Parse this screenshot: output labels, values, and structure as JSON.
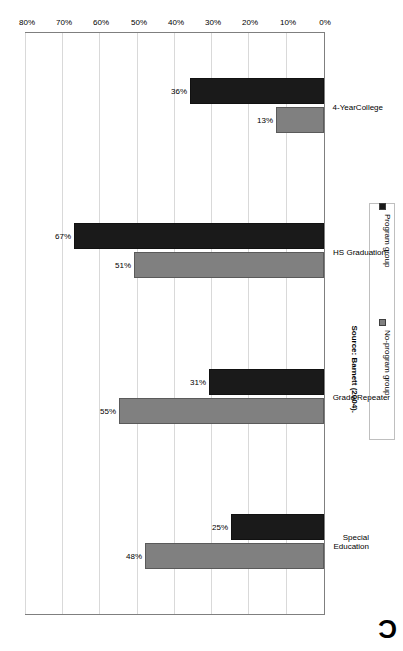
{
  "figure": {
    "panel_letter": "C",
    "source_note": "Source: Barnett (2004)."
  },
  "chart_data": {
    "type": "bar",
    "title": "",
    "subtitle": "",
    "xlabel": "",
    "ylabel": "",
    "orientation": "horizontal-rotated-180",
    "grid": true,
    "legend_position": "right",
    "categories": [
      "Special Education",
      "Grade Repeater",
      "HS Graduation",
      "4-YearCollege"
    ],
    "category_labels": [
      "Special\nEducation",
      "Grade Repeater",
      "HS Graduation",
      "4-YearCollege"
    ],
    "axis": {
      "min": 0,
      "max": 80,
      "step": 10,
      "unit": "%",
      "tick_labels": [
        "0%",
        "10%",
        "20%",
        "30%",
        "40%",
        "50%",
        "60%",
        "70%",
        "80%"
      ],
      "tick_values": [
        0,
        10,
        20,
        30,
        40,
        50,
        60,
        70,
        80
      ]
    },
    "series": [
      {
        "name": "No-program group",
        "color": "#808080",
        "values": [
          48,
          55,
          51,
          13
        ],
        "value_labels": [
          "48%",
          "55%",
          "51%",
          "13%"
        ]
      },
      {
        "name": "Program group",
        "color": "#1a1a1a",
        "values": [
          25,
          31,
          67,
          36
        ],
        "value_labels": [
          "25%",
          "31%",
          "67%",
          "36%"
        ]
      }
    ],
    "legend": [
      {
        "label": "No-program group",
        "color": "#808080"
      },
      {
        "label": "Program group",
        "color": "#1a1a1a"
      }
    ]
  }
}
